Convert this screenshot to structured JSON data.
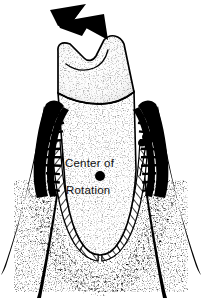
{
  "figure": {
    "kind": "dental-anatomy-illustration",
    "background_color": "#ffffff",
    "ink_color": "#000000",
    "stipple_color": "#6a6a6a",
    "width": 202,
    "height": 298
  },
  "annotations": {
    "center_label_line1": "Center of",
    "center_label_line2": "Rotation",
    "center_marker": {
      "name": "center-of-rotation-dot",
      "shape": "filled-circle",
      "color": "#000000",
      "x": 100,
      "y": 176,
      "radius": 5
    }
  },
  "force_arrow": {
    "name": "applied-force-arrow",
    "direction": "down-right",
    "color": "#000000",
    "tip_x": 106,
    "tip_y": 38
  },
  "parts": [
    {
      "name": "tooth-crown",
      "fill": "#ffffff",
      "stroke": "#000000",
      "texture": "stipple"
    },
    {
      "name": "cementoenamel-junction",
      "fill": "none",
      "stroke": "#000000",
      "texture": "line"
    },
    {
      "name": "tooth-root",
      "fill": "#ffffff",
      "stroke": "#000000",
      "texture": "stipple"
    },
    {
      "name": "gingiva-left",
      "fill": "#000000",
      "stroke": "#000000",
      "texture": "serrated"
    },
    {
      "name": "gingiva-right",
      "fill": "#000000",
      "stroke": "#000000",
      "texture": "serrated"
    },
    {
      "name": "periodontal-ligament-left",
      "fill": "#ffffff",
      "stroke": "#000000",
      "texture": "diagonal-hatch"
    },
    {
      "name": "periodontal-ligament-right",
      "fill": "#ffffff",
      "stroke": "#000000",
      "texture": "diagonal-hatch"
    },
    {
      "name": "alveolar-bone-trabeculae",
      "fill": "#000000",
      "stroke": "#000000",
      "texture": "speckle"
    },
    {
      "name": "mucosa-line-left-outer",
      "fill": "#000000",
      "stroke": "#000000",
      "texture": "taper"
    },
    {
      "name": "mucosa-line-left-inner",
      "fill": "#000000",
      "stroke": "#000000",
      "texture": "taper"
    },
    {
      "name": "mucosa-line-right-outer",
      "fill": "#000000",
      "stroke": "#000000",
      "texture": "taper"
    },
    {
      "name": "mucosa-line-right-inner",
      "fill": "#000000",
      "stroke": "#000000",
      "texture": "taper"
    }
  ]
}
